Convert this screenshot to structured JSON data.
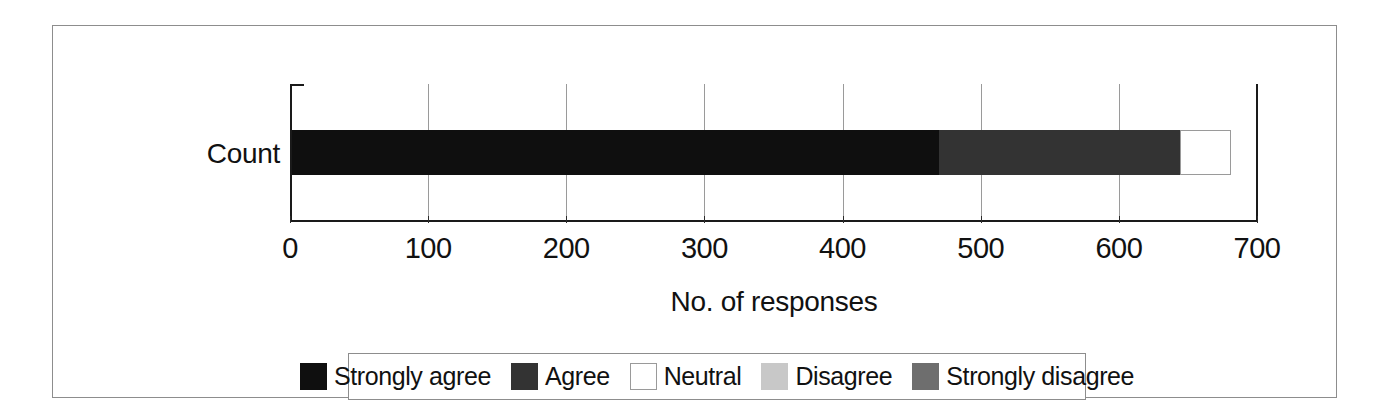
{
  "figure": {
    "category_label": "Count",
    "x_axis_title": "No. of responses"
  },
  "chart_data": {
    "type": "bar",
    "orientation": "horizontal",
    "stacked": true,
    "title": "",
    "subtitle": "",
    "xlabel": "No. of responses",
    "ylabel": "",
    "categories": [
      "Count"
    ],
    "xlim": [
      0,
      700
    ],
    "xticks": [
      0,
      100,
      200,
      300,
      400,
      500,
      600,
      700
    ],
    "xtick_labels": [
      "0",
      "100",
      "200",
      "300",
      "400",
      "500",
      "600",
      "700"
    ],
    "grid": true,
    "grid_axis": "x",
    "legend_position": "bottom",
    "series": [
      {
        "name": "Strongly agree",
        "values": [
          468
        ],
        "color": "#0f0f0f",
        "outlined": false
      },
      {
        "name": "Agree",
        "values": [
          175
        ],
        "color": "#333333",
        "outlined": false
      },
      {
        "name": "Neutral",
        "values": [
          37
        ],
        "color": "#ffffff",
        "outlined": true
      },
      {
        "name": "Disagree",
        "values": [
          0
        ],
        "color": "#c8c8c8",
        "outlined": false
      },
      {
        "name": "Strongly disagree",
        "values": [
          0
        ],
        "color": "#6e6e6e",
        "outlined": false
      }
    ],
    "total": 680,
    "annotations": []
  },
  "legend": {
    "items": [
      {
        "label": "Strongly agree",
        "color": "#0f0f0f",
        "outlined": false
      },
      {
        "label": "Agree",
        "color": "#333333",
        "outlined": false
      },
      {
        "label": "Neutral",
        "color": "#ffffff",
        "outlined": true
      },
      {
        "label": "Disagree",
        "color": "#c8c8c8",
        "outlined": false
      },
      {
        "label": "Strongly disagree",
        "color": "#6e6e6e",
        "outlined": false
      }
    ]
  },
  "colors": {
    "frame": "#8d8d8d",
    "axis": "#1a1a1a",
    "gridline": "#9a9a9a",
    "text": "#111111",
    "background": "#ffffff"
  }
}
